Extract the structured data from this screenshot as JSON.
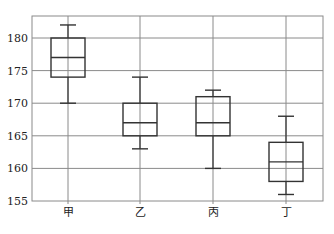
{
  "chart_data": {
    "type": "box",
    "title": "",
    "xlabel": "",
    "ylabel": "",
    "categories": [
      "甲",
      "乙",
      "丙",
      "丁"
    ],
    "ylim": [
      155,
      183
    ],
    "yticks": [
      155,
      160,
      165,
      170,
      175,
      180
    ],
    "grid": true,
    "legend": null,
    "series": [
      {
        "name": "甲",
        "whisker_low": 170,
        "q1": 174,
        "median": 177,
        "q3": 180,
        "whisker_high": 182
      },
      {
        "name": "乙",
        "whisker_low": 163,
        "q1": 165,
        "median": 167,
        "q3": 170,
        "whisker_high": 174
      },
      {
        "name": "丙",
        "whisker_low": 160,
        "q1": 165,
        "median": 167,
        "q3": 171,
        "whisker_high": 172
      },
      {
        "name": "丁",
        "whisker_low": 156,
        "q1": 158,
        "median": 161,
        "q3": 164,
        "whisker_high": 168
      }
    ]
  },
  "style": {
    "grid_color": "#8a8a8a",
    "box_color": "#333333",
    "frame_color": "#8a8a8a"
  }
}
